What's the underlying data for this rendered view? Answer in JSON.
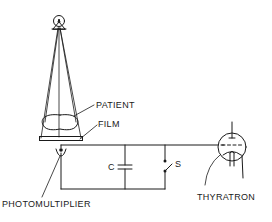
{
  "diagram": {
    "type": "schematic",
    "labels": {
      "patient": "PATIENT",
      "film": "FILM",
      "capacitor": "C",
      "switch": "S",
      "photomultiplier": "PHOTOMULTIPLIER",
      "thyratron": "THYRATRON"
    },
    "components": [
      {
        "id": "xray-source",
        "name": "X-ray tube"
      },
      {
        "id": "beam",
        "name": "X-ray beam cone"
      },
      {
        "id": "patient",
        "name": "Patient"
      },
      {
        "id": "film",
        "name": "Film"
      },
      {
        "id": "photomultiplier",
        "name": "Photomultiplier"
      },
      {
        "id": "capacitor",
        "name": "Capacitor C"
      },
      {
        "id": "switch",
        "name": "Switch S"
      },
      {
        "id": "thyratron",
        "name": "Thyratron tube"
      }
    ],
    "colors": {
      "line": "#1a1a1a",
      "background": "#ffffff"
    }
  }
}
